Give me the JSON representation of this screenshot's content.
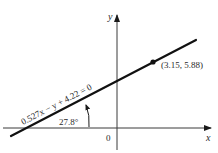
{
  "diagram": {
    "type": "line-on-axes",
    "axes": {
      "x_label": "x",
      "y_label": "y",
      "origin_label": "0"
    },
    "line": {
      "equation": "0.527x − y + 4.22 = 0",
      "slope": 0.527,
      "intercept": 4.22
    },
    "point": {
      "label": "(3.15, 5.88)",
      "x": 3.15,
      "y": 5.88
    },
    "angle": {
      "label": "27.8°",
      "degrees": 27.8
    },
    "colors": {
      "ink": "#1a1a1a",
      "background": "#ffffff"
    }
  }
}
